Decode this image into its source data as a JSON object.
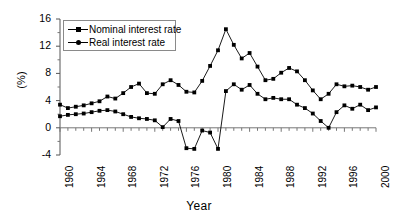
{
  "chart_data": {
    "type": "line",
    "title": "",
    "xlabel": "Year",
    "ylabel": "(%)",
    "xlim": [
      1960,
      2000
    ],
    "ylim": [
      -4,
      16
    ],
    "yticks": [
      16,
      12,
      8,
      4,
      0,
      -4
    ],
    "xticks": [
      1960,
      1964,
      1968,
      1972,
      1976,
      1980,
      1984,
      1988,
      1992,
      1996,
      2000
    ],
    "xtick_labels": [
      "1960",
      "1964",
      "1968",
      "1972",
      "1976",
      "1980",
      "1984",
      "1988",
      "1992",
      "1996",
      "2000"
    ],
    "ytick_labels": [
      "16",
      "12",
      "8",
      "4",
      "0",
      "-4"
    ],
    "grid": false,
    "legend_position": "top-left",
    "x": [
      1960,
      1961,
      1962,
      1963,
      1964,
      1965,
      1966,
      1967,
      1968,
      1969,
      1970,
      1971,
      1972,
      1973,
      1974,
      1975,
      1976,
      1977,
      1978,
      1979,
      1980,
      1981,
      1982,
      1983,
      1984,
      1985,
      1986,
      1987,
      1988,
      1989,
      1990,
      1991,
      1992,
      1993,
      1994,
      1995,
      1996,
      1997,
      1998,
      1999,
      2000
    ],
    "series": [
      {
        "name": "Nominal interest rate",
        "marker": "square",
        "color": "#000000",
        "values": [
          3.4,
          2.9,
          3.1,
          3.3,
          3.6,
          3.9,
          4.6,
          4.3,
          5.1,
          6.0,
          6.5,
          5.1,
          5.0,
          6.4,
          7.0,
          6.3,
          5.3,
          5.2,
          6.9,
          9.1,
          11.4,
          14.5,
          12.2,
          10.2,
          11.0,
          9.0,
          7.0,
          7.2,
          8.1,
          8.8,
          8.3,
          7.0,
          5.5,
          4.2,
          5.0,
          6.4,
          6.1,
          6.2,
          6.0,
          5.6,
          6.0
        ]
      },
      {
        "name": "Real interest rate",
        "marker": "square",
        "color": "#000000",
        "values": [
          1.7,
          1.9,
          2.0,
          2.1,
          2.3,
          2.5,
          2.6,
          2.4,
          2.0,
          1.6,
          1.4,
          1.3,
          1.1,
          0.1,
          1.3,
          1.0,
          -3.0,
          -3.1,
          -0.4,
          -0.7,
          -3.1,
          5.4,
          6.4,
          5.6,
          6.3,
          5.0,
          4.2,
          4.4,
          4.2,
          4.2,
          3.4,
          2.9,
          2.1,
          1.0,
          0.0,
          2.3,
          3.3,
          2.8,
          3.4,
          2.6,
          3.0
        ]
      }
    ]
  },
  "legend": {
    "items": [
      {
        "label": "Nominal interest rate"
      },
      {
        "label": "Real interest rate"
      }
    ]
  },
  "axes": {
    "y_axis_title": "(%)",
    "x_axis_title": "Year"
  }
}
